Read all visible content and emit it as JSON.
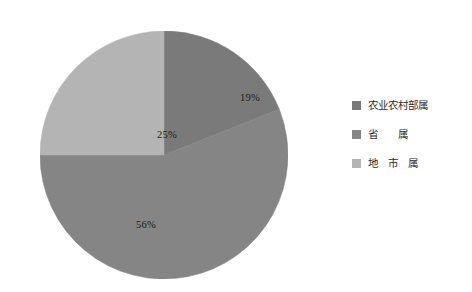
{
  "chart_data": {
    "type": "pie",
    "title": "",
    "subtitle": "",
    "xlabel": "",
    "ylabel": "",
    "grid": false,
    "legend_position": "right",
    "start_angle_deg": 0,
    "direction": "clockwise",
    "categories": [
      "农业农村部属",
      "省　　属",
      "地　市　属"
    ],
    "values": [
      19,
      56,
      25
    ],
    "value_unit": "%",
    "data_labels": [
      "19%",
      "56%",
      "25%"
    ],
    "colors": [
      "#7a7a7a",
      "#858585",
      "#b4b4b4"
    ],
    "slices": [
      {
        "label": "农业农村部属",
        "value": 19,
        "data_label": "19%",
        "color": "#7a7a7a"
      },
      {
        "label": "省　　属",
        "value": 56,
        "data_label": "56%",
        "color": "#858585"
      },
      {
        "label": "地　市　属",
        "value": 25,
        "data_label": "25%",
        "color": "#b4b4b4"
      }
    ]
  },
  "legend": {
    "items": [
      {
        "label": "农业农村部属",
        "color": "#7a7a7a"
      },
      {
        "label": "省　　属",
        "color": "#858585"
      },
      {
        "label": "地　市　属",
        "color": "#b4b4b4"
      }
    ]
  },
  "canvas": {
    "background": "#ffffff",
    "label_color": "#1a1a1a",
    "legend_text_color": "#2b2b2b"
  }
}
